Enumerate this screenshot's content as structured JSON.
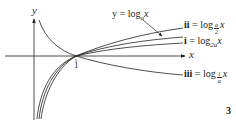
{
  "figure": {
    "number": "3",
    "axes": {
      "x_label": "x",
      "y_label": "y",
      "intercept_label": "1"
    },
    "curves": [
      {
        "id": "main",
        "label_prefix": "y = log",
        "base": "a",
        "arg": "x",
        "description": "y = log_a x"
      },
      {
        "id": "ii",
        "label_prefix": "ii",
        "eq": " = log",
        "base_num": "a",
        "base_den": "2",
        "arg": "x",
        "description": "ii = log_{a/2} x"
      },
      {
        "id": "i",
        "label_prefix": "i",
        "eq": " = log",
        "base": "2a",
        "arg": "x",
        "description": "i = log_{2a} x"
      },
      {
        "id": "iii",
        "label_prefix": "iii",
        "eq": " = log",
        "base_num": "1",
        "base_den": "a",
        "arg": "x",
        "description": "iii = log_{1/a} x"
      }
    ],
    "colors": {
      "ink": "#231f20",
      "background": "#ffffff"
    }
  }
}
